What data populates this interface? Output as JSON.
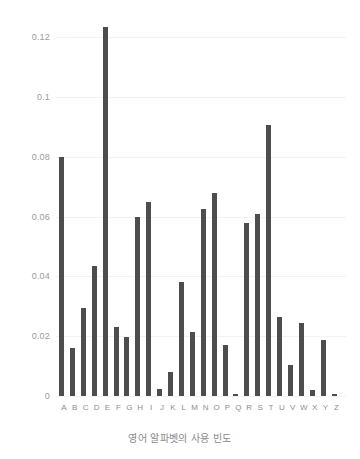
{
  "chart_data": {
    "type": "bar",
    "title": "",
    "xlabel": "영어 알파벳의 사용 빈도",
    "ylabel": "",
    "categories": [
      "A",
      "B",
      "C",
      "D",
      "E",
      "F",
      "G",
      "H",
      "I",
      "J",
      "K",
      "L",
      "M",
      "N",
      "O",
      "P",
      "Q",
      "R",
      "S",
      "T",
      "U",
      "V",
      "W",
      "X",
      "Y",
      "Z"
    ],
    "values": [
      0.08,
      0.016,
      0.0295,
      0.0435,
      0.1235,
      0.0232,
      0.0197,
      0.06,
      0.0648,
      0.0022,
      0.0081,
      0.038,
      0.0214,
      0.0625,
      0.068,
      0.0171,
      0.0008,
      0.0578,
      0.061,
      0.0908,
      0.0266,
      0.0103,
      0.0243,
      0.002,
      0.0186,
      0.0007
    ],
    "series": [
      {
        "name": "영어 알파벳의 사용 빈도",
        "values": [
          0.08,
          0.016,
          0.0295,
          0.0435,
          0.1235,
          0.0232,
          0.0197,
          0.06,
          0.0648,
          0.0022,
          0.0081,
          0.038,
          0.0214,
          0.0625,
          0.068,
          0.0171,
          0.0008,
          0.0578,
          0.061,
          0.0908,
          0.0266,
          0.0103,
          0.0243,
          0.002,
          0.0186,
          0.0007
        ]
      }
    ],
    "ylim": [
      0,
      0.1285
    ],
    "yticks": [
      0,
      0.02,
      0.04,
      0.06,
      0.08,
      0.1,
      0.12
    ],
    "ytick_labels": [
      "0",
      "0.02",
      "0.04",
      "0.06",
      "0.08",
      "0.1",
      "0.12"
    ],
    "grid": true,
    "legend": false,
    "legend_position": "none",
    "colors": {
      "bar": "#4d4d4d",
      "background": "#ffffff",
      "gridline": "#f2f2f2",
      "tick_text": "#9a9a9a",
      "axis_title_text": "#8a8a8a"
    }
  }
}
